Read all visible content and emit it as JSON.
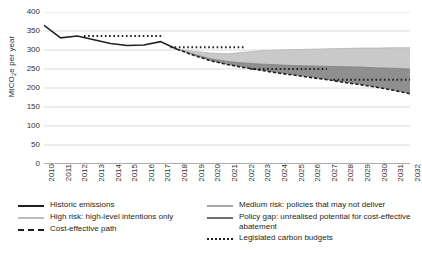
{
  "chart_data": {
    "type": "line",
    "title": "",
    "xlabel": "",
    "ylabel": "MtCO2e per year",
    "ylabel_prefix": "MtCO",
    "ylabel_sub": "2",
    "ylabel_suffix": "e per year",
    "ylim": [
      0,
      400
    ],
    "ytick_step": 50,
    "yticks": [
      400,
      350,
      300,
      250,
      200,
      150,
      100,
      50,
      0
    ],
    "xlim": [
      2010,
      2032
    ],
    "categories": [
      2010,
      2011,
      2012,
      2013,
      2014,
      2015,
      2016,
      2017,
      2018,
      2019,
      2020,
      2021,
      2022,
      2023,
      2024,
      2025,
      2026,
      2027,
      2028,
      2029,
      2030,
      2031,
      2032
    ],
    "grid": "horizontal",
    "legend_position": "bottom",
    "series": [
      {
        "name": "Historic emissions",
        "key": "historic",
        "style": "solid",
        "color": "#231f20",
        "x": [
          2010,
          2011,
          2012,
          2013,
          2014,
          2015,
          2016,
          2017,
          2018
        ],
        "values": [
          365,
          332,
          337,
          327,
          317,
          312,
          313,
          322,
          302
        ]
      },
      {
        "name": "High risk: high-level intentions only",
        "key": "high_risk",
        "style": "solid",
        "color": "#bdbdbd",
        "x": [
          2018,
          2019,
          2020,
          2021,
          2022,
          2023,
          2024,
          2025,
          2026,
          2027,
          2028,
          2029,
          2030,
          2031,
          2032
        ],
        "values": [
          302,
          297,
          292,
          290,
          294,
          298,
          300,
          301,
          302,
          303,
          304,
          305,
          305,
          306,
          306
        ]
      },
      {
        "name": "Medium risk: policies that may not deliver",
        "key": "medium_risk",
        "style": "solid",
        "color": "#8c8c8c",
        "x": [
          2018,
          2019,
          2020,
          2021,
          2022,
          2023,
          2024,
          2025,
          2026,
          2027,
          2028,
          2029,
          2030,
          2031,
          2032
        ],
        "values": [
          302,
          289,
          277,
          270,
          266,
          263,
          261,
          259,
          258,
          257,
          256,
          255,
          253,
          252,
          250
        ]
      },
      {
        "name": "Policy gap: unrealised potential for cost-effective abatement",
        "key": "policy_gap",
        "style": "solid",
        "color": "#6e6e6e",
        "x": [
          2018,
          2019,
          2020,
          2021,
          2022,
          2023,
          2024,
          2025,
          2026,
          2027,
          2028,
          2029,
          2030,
          2031,
          2032
        ],
        "values": [
          302,
          289,
          277,
          270,
          266,
          263,
          261,
          259,
          258,
          257,
          256,
          255,
          253,
          252,
          250
        ]
      },
      {
        "name": "Cost-effective path",
        "key": "cost_effective",
        "style": "dashed",
        "color": "#231f20",
        "x": [
          2018,
          2019,
          2020,
          2021,
          2022,
          2023,
          2024,
          2025,
          2026,
          2027,
          2028,
          2029,
          2030,
          2031,
          2032
        ],
        "values": [
          302,
          286,
          272,
          262,
          254,
          247,
          240,
          234,
          228,
          222,
          215,
          209,
          202,
          194,
          185
        ]
      },
      {
        "name": "Legislated carbon budgets",
        "key": "carbon_budgets",
        "style": "dotted",
        "color": "#231f20",
        "segments": [
          {
            "x0": 2012.4,
            "x1": 2017.2,
            "value": 337
          },
          {
            "x0": 2017.6,
            "x1": 2022.0,
            "value": 307
          },
          {
            "x0": 2022.4,
            "x1": 2027.0,
            "value": 250
          },
          {
            "x0": 2027.4,
            "x1": 2032.0,
            "value": 222
          }
        ]
      }
    ]
  },
  "legend": {
    "left_items": [
      {
        "label": "Historic emissions",
        "marker": "solid",
        "color": "#231f20"
      },
      {
        "label": "High risk: high-level intentions only",
        "marker": "solid",
        "color": "#bdbdbd"
      },
      {
        "label": "Cost-effective path",
        "marker": "dashed",
        "color": "#231f20"
      }
    ],
    "right_items": [
      {
        "label": "Medium risk: policies that may not deliver",
        "marker": "solid",
        "color": "#a8a8a8"
      },
      {
        "label": "Policy gap: unrealised potential for cost-effective abatement",
        "marker": "solid",
        "color": "#6e6e6e"
      },
      {
        "label": "Legislated carbon budgets",
        "marker": "dotted",
        "color": "#231f20"
      }
    ]
  }
}
